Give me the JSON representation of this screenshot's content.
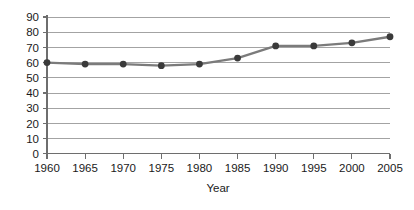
{
  "chart_data": {
    "type": "line",
    "title": "",
    "xlabel": "Year",
    "ylabel": "",
    "x": [
      1960,
      1965,
      1970,
      1975,
      1980,
      1985,
      1990,
      1995,
      2000,
      2005
    ],
    "values": [
      60,
      59,
      59,
      58,
      59,
      63,
      71,
      71,
      73,
      77
    ],
    "series": [
      {
        "name": "",
        "values": [
          60,
          59,
          59,
          58,
          59,
          63,
          71,
          71,
          73,
          77
        ]
      }
    ],
    "xtick_labels": [
      "1960",
      "1965",
      "1970",
      "1975",
      "1980",
      "1985",
      "1990",
      "1995",
      "2000",
      "2005"
    ],
    "ytick_labels": [
      "0",
      "10",
      "20",
      "30",
      "40",
      "50",
      "60",
      "70",
      "80",
      "90"
    ],
    "yticks": [
      0,
      10,
      20,
      30,
      40,
      50,
      60,
      70,
      80,
      90
    ],
    "xlim": [
      1960,
      2005
    ],
    "ylim": [
      0,
      90
    ],
    "grid": true,
    "grid_axis": "y",
    "legend": false,
    "legend_position": "none",
    "colors": {
      "line": "#7b7b7b",
      "marker": "#3a3a3a",
      "grid": "#8c8c8c",
      "axis": "#6e6e6e",
      "text": "#1a1a1a",
      "background": "#ffffff"
    }
  }
}
